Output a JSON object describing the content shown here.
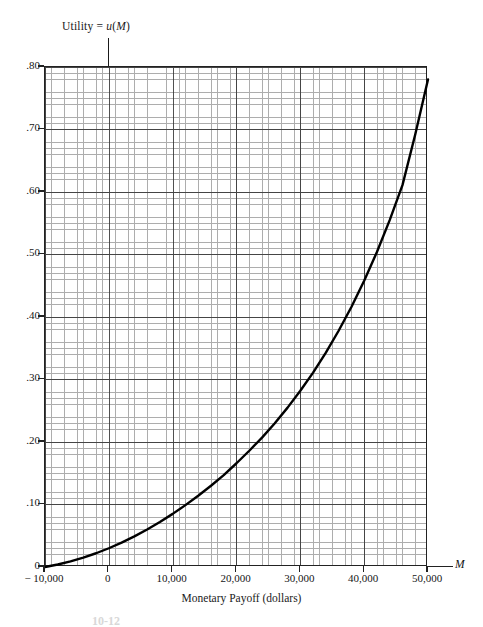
{
  "chart_data": {
    "type": "line",
    "title": "Utility = u(M)",
    "title_plain": "Utility = u(M)",
    "xlabel": "Monetary Payoff (dollars)",
    "ylabel": "",
    "x_axis_symbol": "M",
    "xlim": [
      -10000,
      50000
    ],
    "ylim": [
      0,
      0.8
    ],
    "x_ticks": [
      -10000,
      0,
      10000,
      20000,
      30000,
      40000,
      50000
    ],
    "x_tick_labels": [
      "− 10,000",
      "0",
      "10,000",
      "20,000",
      "30,000",
      "40,000",
      "50,000"
    ],
    "y_ticks": [
      0,
      0.1,
      0.2,
      0.3,
      0.4,
      0.5,
      0.6,
      0.7,
      0.8
    ],
    "y_tick_labels": [
      "0",
      ".10",
      ".20",
      ".30",
      ".40",
      ".50",
      ".60",
      ".70",
      ".80"
    ],
    "grid": true,
    "grid_minor": true,
    "minor_divisions_per_major": 10,
    "legend": null,
    "series": [
      {
        "name": "u(M)",
        "color": "#000000",
        "line_width": 2.4,
        "x": [
          -10000,
          -8000,
          -6000,
          -4000,
          -2000,
          0,
          2000,
          4000,
          6000,
          8000,
          10000,
          12000,
          14000,
          16000,
          18000,
          20000,
          22000,
          24000,
          26000,
          28000,
          30000,
          32000,
          34000,
          36000,
          38000,
          40000,
          42000,
          44000,
          46000,
          48000,
          50000
        ],
        "y": [
          0.0,
          0.004,
          0.009,
          0.015,
          0.022,
          0.03,
          0.039,
          0.049,
          0.06,
          0.072,
          0.085,
          0.099,
          0.114,
          0.13,
          0.147,
          0.166,
          0.186,
          0.207,
          0.23,
          0.255,
          0.282,
          0.311,
          0.343,
          0.378,
          0.416,
          0.458,
          0.504,
          0.555,
          0.611,
          0.692,
          0.78
        ]
      }
    ]
  },
  "annotations": {
    "title_prefix": "Utility",
    "title_equals": "=",
    "title_func_u": "u",
    "title_paren_open": "(",
    "title_var_m": "M",
    "title_paren_close": ")"
  },
  "figure": {
    "caption": "10-12"
  }
}
